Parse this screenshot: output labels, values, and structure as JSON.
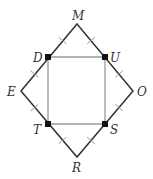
{
  "diagram": {
    "type": "geometry",
    "outer_vertices": {
      "M": {
        "x": 77,
        "y": 24
      },
      "O": {
        "x": 133,
        "y": 91
      },
      "R": {
        "x": 77,
        "y": 157
      },
      "E": {
        "x": 21,
        "y": 91
      }
    },
    "inner_vertices": {
      "D": {
        "x": 48,
        "y": 57
      },
      "U": {
        "x": 105,
        "y": 57
      },
      "S": {
        "x": 105,
        "y": 124
      },
      "T": {
        "x": 48,
        "y": 124
      }
    },
    "labels": {
      "M": "M",
      "U": "U",
      "O": "O",
      "S": "S",
      "R": "R",
      "T": "T",
      "E": "E",
      "D": "D"
    },
    "colors": {
      "outer_line": "#333333",
      "inner_line": "#999999",
      "tick": "#aaaaaa",
      "point": "#111111"
    }
  }
}
